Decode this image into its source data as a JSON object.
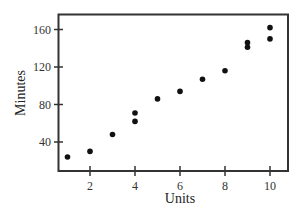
{
  "chart_data": {
    "type": "scatter",
    "title": "",
    "xlabel": "Units",
    "ylabel": "Minutes",
    "xlim": [
      0.5,
      10.8
    ],
    "ylim": [
      8,
      168
    ],
    "xticks": [
      2,
      4,
      6,
      8,
      10
    ],
    "yticks": [
      40,
      80,
      120,
      160
    ],
    "grid": false,
    "legend": null,
    "points": [
      {
        "x": 1,
        "y": 24
      },
      {
        "x": 2,
        "y": 30
      },
      {
        "x": 3,
        "y": 48
      },
      {
        "x": 4,
        "y": 62
      },
      {
        "x": 4,
        "y": 71
      },
      {
        "x": 5,
        "y": 86
      },
      {
        "x": 6,
        "y": 94
      },
      {
        "x": 7,
        "y": 107
      },
      {
        "x": 8,
        "y": 116
      },
      {
        "x": 9,
        "y": 141
      },
      {
        "x": 9,
        "y": 146
      },
      {
        "x": 10,
        "y": 150
      },
      {
        "x": 10,
        "y": 162
      }
    ],
    "colors": {
      "marker": "#111111",
      "axis": "#333333"
    }
  }
}
